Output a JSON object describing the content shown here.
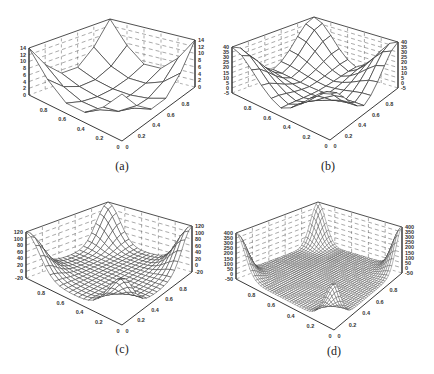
{
  "figure": {
    "panels": [
      {
        "id": "a",
        "caption": "(a)",
        "zticks": [
          "0",
          "2",
          "4",
          "6",
          "8",
          "10",
          "12",
          "14"
        ],
        "zmin": 0,
        "zmax": 14,
        "grid_n": 6,
        "peak": 14
      },
      {
        "id": "b",
        "caption": "(b)",
        "zticks": [
          "-5",
          "0",
          "5",
          "10",
          "15",
          "20",
          "25",
          "30",
          "35",
          "40"
        ],
        "zmin": -5,
        "zmax": 40,
        "grid_n": 11,
        "peak": 40
      },
      {
        "id": "c",
        "caption": "(c)",
        "zticks": [
          "-20",
          "0",
          "20",
          "40",
          "60",
          "80",
          "100",
          "120"
        ],
        "zmin": -20,
        "zmax": 120,
        "grid_n": 21,
        "peak": 120
      },
      {
        "id": "d",
        "caption": "(d)",
        "zticks": [
          "-50",
          "0",
          "50",
          "100",
          "150",
          "200",
          "250",
          "300",
          "350",
          "400"
        ],
        "zmin": -50,
        "zmax": 400,
        "grid_n": 41,
        "peak": 400
      }
    ],
    "xy_ticks": [
      "0",
      "0.2",
      "0.4",
      "0.6",
      "0.8"
    ]
  },
  "chart_data": [
    {
      "type": "surface",
      "title": "(a)",
      "xlabel": "",
      "ylabel": "",
      "zlabel": "",
      "x_range": [
        0,
        1
      ],
      "y_range": [
        0,
        1
      ],
      "zlim": [
        0,
        14
      ],
      "x_ticks": [
        0,
        0.2,
        0.4,
        0.6,
        0.8
      ],
      "y_ticks": [
        0,
        0.2,
        0.4,
        0.6,
        0.8
      ],
      "z_ticks": [
        0,
        2,
        4,
        6,
        8,
        10,
        12,
        14
      ],
      "grid": true,
      "mesh": "6x6",
      "description": "bowl-shaped surface, corners peak near 14, interior near 0"
    },
    {
      "type": "surface",
      "title": "(b)",
      "xlabel": "",
      "ylabel": "",
      "zlabel": "",
      "x_range": [
        0,
        1
      ],
      "y_range": [
        0,
        1
      ],
      "zlim": [
        -5,
        40
      ],
      "x_ticks": [
        0,
        0.2,
        0.4,
        0.6,
        0.8
      ],
      "y_ticks": [
        0,
        0.2,
        0.4,
        0.6,
        0.8
      ],
      "z_ticks": [
        -5,
        0,
        5,
        10,
        15,
        20,
        25,
        30,
        35,
        40
      ],
      "grid": true,
      "mesh": "11x11",
      "description": "flat interior near 0, sharp corner peaks near 40"
    },
    {
      "type": "surface",
      "title": "(c)",
      "xlabel": "",
      "ylabel": "",
      "zlabel": "",
      "x_range": [
        0,
        1
      ],
      "y_range": [
        0,
        1
      ],
      "zlim": [
        -20,
        120
      ],
      "x_ticks": [
        0,
        0.2,
        0.4,
        0.6,
        0.8
      ],
      "y_ticks": [
        0,
        0.2,
        0.4,
        0.6,
        0.8
      ],
      "z_ticks": [
        -20,
        0,
        20,
        40,
        60,
        80,
        100,
        120
      ],
      "grid": true,
      "mesh": "21x21",
      "description": "flat interior near 0, sharp corner spikes near 120"
    },
    {
      "type": "surface",
      "title": "(d)",
      "xlabel": "",
      "ylabel": "",
      "zlabel": "",
      "x_range": [
        0,
        1
      ],
      "y_range": [
        0,
        1
      ],
      "zlim": [
        -50,
        400
      ],
      "x_ticks": [
        0,
        0.2,
        0.4,
        0.6,
        0.8
      ],
      "y_ticks": [
        0,
        0.2,
        0.4,
        0.6,
        0.8
      ],
      "z_ticks": [
        -50,
        0,
        50,
        100,
        150,
        200,
        250,
        300,
        350,
        400
      ],
      "grid": true,
      "mesh": "41x41",
      "description": "flat interior near 0, very sharp corner spikes near 400"
    }
  ]
}
